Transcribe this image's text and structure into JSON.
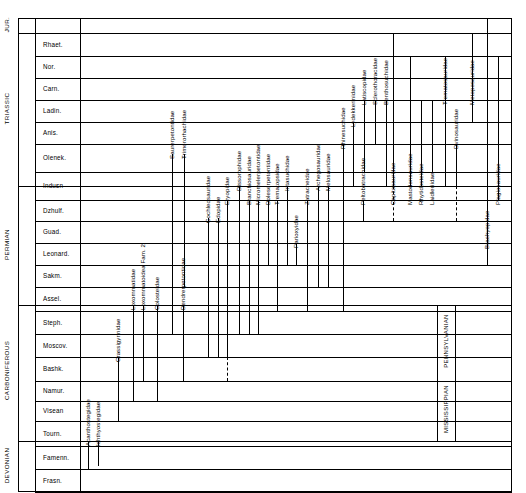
{
  "chart_data": {
    "type": "table",
    "xlabel": "",
    "ylabel": "Geologic time",
    "grid": true,
    "legend": "none",
    "eras": [
      {
        "name": "JUR.",
        "top": 18,
        "bottom": 33
      },
      {
        "name": "TRIASSIC",
        "top": 33,
        "bottom": 186
      },
      {
        "name": "PERMIAN",
        "top": 186,
        "bottom": 305
      },
      {
        "name": "CARBONIFEROUS",
        "top": 305,
        "bottom": 441
      },
      {
        "name": "DEVONIAN",
        "top": 441,
        "bottom": 492
      }
    ],
    "subsystems": [
      {
        "name": "PENNSYLVANIAN",
        "top": 305,
        "bottom": 381
      },
      {
        "name": "MISSISSIPPIAN",
        "top": 381,
        "bottom": 441
      }
    ],
    "stages": [
      {
        "name": "",
        "top": 18,
        "bottom": 33
      },
      {
        "name": "Rhaet.",
        "top": 33,
        "bottom": 56
      },
      {
        "name": "Nor.",
        "top": 56,
        "bottom": 78
      },
      {
        "name": "Carn.",
        "top": 78,
        "bottom": 100
      },
      {
        "name": "Ladin.",
        "top": 100,
        "bottom": 122
      },
      {
        "name": "Anis.",
        "top": 122,
        "bottom": 144
      },
      {
        "name": "Olenek.",
        "top": 144,
        "bottom": 172
      },
      {
        "name": "Indusn",
        "top": 172,
        "bottom": 200
      },
      {
        "name": "Dzhulf.",
        "top": 200,
        "bottom": 221
      },
      {
        "name": "Guad.",
        "top": 221,
        "bottom": 243
      },
      {
        "name": "Leonard.",
        "top": 243,
        "bottom": 265
      },
      {
        "name": "Sakm.",
        "top": 265,
        "bottom": 287
      },
      {
        "name": "Assel.",
        "top": 287,
        "bottom": 311
      },
      {
        "name": "Steph.",
        "top": 311,
        "bottom": 334
      },
      {
        "name": "Moscov.",
        "top": 334,
        "bottom": 357
      },
      {
        "name": "Bashk.",
        "top": 357,
        "bottom": 381
      },
      {
        "name": "Namur.",
        "top": 381,
        "bottom": 401
      },
      {
        "name": "Visean",
        "top": 401,
        "bottom": 421
      },
      {
        "name": "Tourn.",
        "top": 421,
        "bottom": 446
      },
      {
        "name": "Famenn.",
        "top": 446,
        "bottom": 469
      },
      {
        "name": "Frasn.",
        "top": 469,
        "bottom": 492
      }
    ],
    "taxa": [
      {
        "name": "Acanthostegidae",
        "x": 88,
        "top": 441,
        "bottom": 469,
        "label_y": 440,
        "dashed_top": null
      },
      {
        "name": "Ichthyostegidae",
        "x": 98,
        "top": 441,
        "bottom": 466,
        "label_y": 440,
        "dashed_top": null
      },
      {
        "name": "Crassigyrinidae",
        "x": 118,
        "top": 357,
        "bottom": 421,
        "label_y": 356,
        "dashed_top": null
      },
      {
        "name": "Loxommatidae",
        "x": 133,
        "top": 305,
        "bottom": 401,
        "label_y": 304,
        "dashed_top": null
      },
      {
        "name": "Loxommatoidea Fam. 2",
        "x": 143,
        "top": 305,
        "bottom": 381,
        "label_y": 304,
        "dashed_top": null
      },
      {
        "name": "Colosteidae",
        "x": 157,
        "top": 305,
        "bottom": 401,
        "label_y": 304,
        "dashed_top": null
      },
      {
        "name": "Dendrerpetontidae",
        "x": 183,
        "top": 305,
        "bottom": 381,
        "label_y": 304,
        "dashed_top": null
      },
      {
        "name": "Saurerpetontidae",
        "x": 172,
        "top": 154,
        "bottom": 334,
        "label_y": 153,
        "dashed_top": null
      },
      {
        "name": "Trimerorhachidae",
        "x": 184,
        "top": 154,
        "bottom": 287,
        "label_y": 153,
        "dashed_top": null
      },
      {
        "name": "Cochleosauridae",
        "x": 208,
        "top": 218,
        "bottom": 357,
        "label_y": 217,
        "dashed_top": null
      },
      {
        "name": "Edopidae",
        "x": 218,
        "top": 218,
        "bottom": 357,
        "label_y": 217,
        "dashed_top": null
      },
      {
        "name": "Eryopidae",
        "x": 227,
        "top": 200,
        "bottom": 357,
        "label_y": 199,
        "dashed_top": 381
      },
      {
        "name": "Dissorophidae",
        "x": 239,
        "top": 186,
        "bottom": 334,
        "label_y": 185,
        "dashed_top": null
      },
      {
        "name": "Branchiosauridae",
        "x": 249,
        "top": 200,
        "bottom": 334,
        "label_y": 199,
        "dashed_top": null
      },
      {
        "name": "Micromelerpetontidae",
        "x": 258,
        "top": 200,
        "bottom": 334,
        "label_y": 199,
        "dashed_top": null
      },
      {
        "name": "Doleserpetontidae",
        "x": 268,
        "top": 200,
        "bottom": 265,
        "label_y": 199,
        "dashed_top": null
      },
      {
        "name": "Trematopsidae",
        "x": 277,
        "top": 200,
        "bottom": 311,
        "label_y": 199,
        "dashed_top": null
      },
      {
        "name": "Intasuchidae",
        "x": 287,
        "top": 186,
        "bottom": 265,
        "label_y": 185,
        "dashed_top": null
      },
      {
        "name": "Parioxyidae",
        "x": 296,
        "top": 243,
        "bottom": 265,
        "label_y": 242,
        "dashed_top": null
      },
      {
        "name": "Zatracheidae",
        "x": 307,
        "top": 200,
        "bottom": 311,
        "label_y": 199,
        "dashed_top": null
      },
      {
        "name": "Archegosauridae",
        "x": 318,
        "top": 186,
        "bottom": 287,
        "label_y": 185,
        "dashed_top": null
      },
      {
        "name": "Melosauridae",
        "x": 328,
        "top": 186,
        "bottom": 287,
        "label_y": 185,
        "dashed_top": null
      },
      {
        "name": "Rhinesuchidae",
        "x": 343,
        "top": 144,
        "bottom": 311,
        "label_y": 143,
        "dashed_top": null
      },
      {
        "name": "Lydekkerinidae",
        "x": 353,
        "top": 122,
        "bottom": 186,
        "label_y": 121,
        "dashed_top": null
      },
      {
        "name": "Latiscopidae",
        "x": 364,
        "top": 100,
        "bottom": 172,
        "label_y": 99,
        "dashed_top": null
      },
      {
        "name": "Sclerothoracidae",
        "x": 375,
        "top": 100,
        "bottom": 144,
        "label_y": 99,
        "dashed_top": null
      },
      {
        "name": "Peltobatrachidae",
        "x": 363,
        "top": 200,
        "bottom": 221,
        "label_y": 199,
        "dashed_top": null
      },
      {
        "name": "Benthosuchidae",
        "x": 386,
        "top": 100,
        "bottom": 186,
        "label_y": 99,
        "dashed_top": null
      },
      {
        "name": "Capitosauridae",
        "x": 393,
        "top": 33,
        "bottom": 186,
        "label_y": 199,
        "dashed_top": 221
      },
      {
        "name": "Mastodonsauridae",
        "x": 410,
        "top": 56,
        "bottom": 186,
        "label_y": 199,
        "dashed_top": null
      },
      {
        "name": "Rhytidosteidae",
        "x": 421,
        "top": 100,
        "bottom": 186,
        "label_y": 199,
        "dashed_top": null
      },
      {
        "name": "Laidleriidae",
        "x": 432,
        "top": 100,
        "bottom": 172,
        "label_y": 199,
        "dashed_top": null
      },
      {
        "name": "Trematosauridae",
        "x": 445,
        "top": 56,
        "bottom": 186,
        "label_y": 99,
        "dashed_top": null
      },
      {
        "name": "Dvinosauridae",
        "x": 456,
        "top": 144,
        "bottom": 186,
        "label_y": 143,
        "dashed_top": 221
      },
      {
        "name": "Metoposauridae",
        "x": 472,
        "top": 33,
        "bottom": 122,
        "label_y": 99,
        "dashed_top": null
      },
      {
        "name": "Brachyopidae",
        "x": 487,
        "top": 18,
        "bottom": 265,
        "label_y": 243,
        "dashed_top": null
      },
      {
        "name": "Plagiosauridae",
        "x": 498,
        "top": 56,
        "bottom": 200,
        "label_y": 199,
        "dashed_top": null
      }
    ],
    "axis_columns": {
      "era_col_left": 18,
      "era_col_right": 35,
      "stage_col_left": 35,
      "chart_left": 80,
      "chart_right": 512,
      "sub_col_left": 437,
      "sub_col_right": 455
    }
  }
}
